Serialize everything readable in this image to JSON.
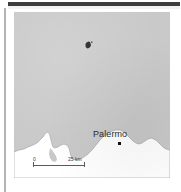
{
  "figure": {
    "type": "locator-map",
    "region": "Northern Sicily coast — Tyrrhenian Sea",
    "sea_color": "#c9c9c9",
    "land_color": "#ffffff",
    "coast_line_color": "#9a9a9a",
    "label_color": "#2b2b2b"
  },
  "rules": {
    "top_rule_color": "#3d3d3d",
    "left_rule_color": "#b4b4b4"
  },
  "labels": [
    {
      "name": "Palermo",
      "text": "Palermo",
      "marker": "square-dot",
      "marker_color": "#111111"
    }
  ],
  "markers": [
    {
      "name": "island-marker",
      "shape": "irregular-blob",
      "color": "#1a1a1a"
    }
  ],
  "scale_bar": {
    "min_label": "0",
    "max_label": "25 km",
    "units": "km",
    "length_value": 25,
    "tick_color": "#5a5a5a"
  }
}
